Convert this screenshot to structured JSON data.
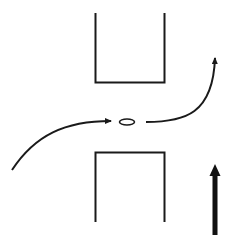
{
  "diagram": {
    "background": "#ffffff",
    "stroke_color": "#1a1a1a",
    "elements": {
      "top_block": {
        "shape": "open-top-rectangle",
        "x1": 95,
        "x2": 164,
        "y_top": 13,
        "y_bottom": 83
      },
      "bottom_block": {
        "shape": "open-bottom-rectangle",
        "x1": 95,
        "x2": 164,
        "y_top": 152,
        "y_bottom": 222
      },
      "particle": {
        "shape": "ellipse",
        "cx": 127,
        "cy": 122,
        "rx": 7.5,
        "ry": 3
      },
      "incoming_path": {
        "shape": "curved-arrow",
        "from": [
          12,
          170
        ],
        "to": [
          113,
          121
        ]
      },
      "outgoing_path": {
        "shape": "curved-arrow",
        "from": [
          146,
          122
        ],
        "to": [
          215,
          52
        ]
      },
      "direction_arrow": {
        "shape": "thick-arrow-up",
        "x": 215,
        "y_tip": 164,
        "y_tail": 235
      }
    }
  }
}
